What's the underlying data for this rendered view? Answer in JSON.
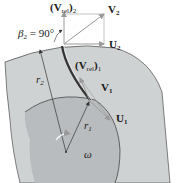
{
  "figure": {
    "labels": {
      "vrel2": "(V",
      "vrel2_sub": "rel",
      "vrel2_close": ")",
      "vrel2_index": "2",
      "v2": "V",
      "v2_sub": "2",
      "beta2": "β",
      "beta2_sub": "2",
      "beta2_value": " = 90°",
      "u2": "U",
      "u2_sub": "2",
      "r2": "r",
      "r2_sub": "2",
      "vrel1": "(V",
      "vrel1_sub": "rel",
      "vrel1_close": ")",
      "vrel1_index": "1",
      "v1": "V",
      "v1_sub": "1",
      "u1": "U",
      "u1_sub": "1",
      "r1": "r",
      "r1_sub": "1",
      "omega": "ω"
    },
    "colors": {
      "outer_disk": "#cfd2d3",
      "inner_disk": "#b9bcbe",
      "vector_fill": "#b8b8b8",
      "line": "#333333"
    }
  }
}
